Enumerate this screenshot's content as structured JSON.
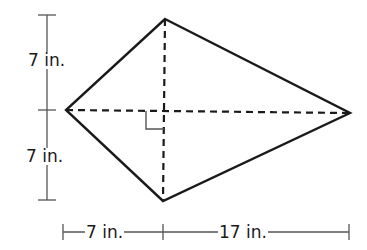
{
  "figure": {
    "type": "kite",
    "vertices": {
      "top": [
        165,
        19
      ],
      "right": [
        350,
        113
      ],
      "bottom": [
        163,
        201
      ],
      "left": [
        66,
        110
      ]
    },
    "intersection": [
      163,
      112
    ],
    "right_angle_marker": true,
    "colors": {
      "stroke": "#1a1a1a",
      "dimension": "#555555",
      "background": "#ffffff"
    }
  },
  "dimensions": {
    "upper_vertical": "7 in.",
    "lower_vertical": "7 in.",
    "left_horizontal": "7 in.",
    "right_horizontal": "17 in."
  }
}
